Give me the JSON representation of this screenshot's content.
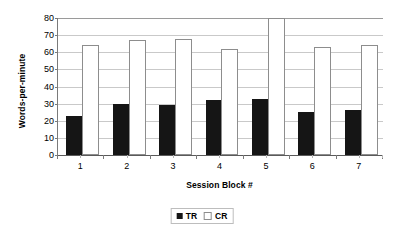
{
  "chart_data": {
    "type": "bar",
    "title": "",
    "xlabel": "Session Block #",
    "ylabel": "Words-per-minute",
    "categories": [
      "1",
      "2",
      "3",
      "4",
      "5",
      "6",
      "7"
    ],
    "ylim": [
      0,
      80
    ],
    "yticks": [
      0,
      10,
      20,
      30,
      40,
      50,
      60,
      70,
      80
    ],
    "ytick_labels": [
      "0",
      "10",
      "20",
      "30",
      "40",
      "50",
      "60",
      "70",
      "80"
    ],
    "grid": true,
    "legend_position": "bottom",
    "series": [
      {
        "name": "TR",
        "color": "#151515",
        "style": "filled",
        "values": [
          23,
          29.5,
          29,
          32,
          33,
          25,
          26.5
        ]
      },
      {
        "name": "CR",
        "color": "#ffffff",
        "style": "hollow",
        "values": [
          64,
          67,
          68,
          62,
          80,
          63,
          64
        ]
      }
    ]
  },
  "axes": {
    "y_title": "Words-per-minute",
    "x_title": "Session Block #"
  },
  "legend": {
    "entries": [
      {
        "label": "TR",
        "swatch": "filled-square"
      },
      {
        "label": "CR",
        "swatch": "hollow-square"
      }
    ]
  },
  "colors": {
    "series_tr": "#151515",
    "series_cr": "#ffffff",
    "gridline": "#c9c9c9",
    "axis": "#5a5a5a",
    "background": "#ffffff"
  }
}
